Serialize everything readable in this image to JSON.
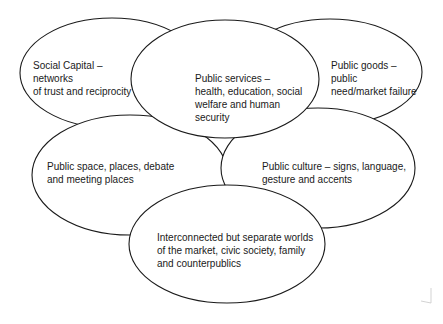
{
  "diagram": {
    "type": "overlapping-ellipses",
    "stroke_color": "#1a1a1a",
    "fill_color": "#ffffff",
    "nodes": [
      {
        "id": "social-capital",
        "label": "Social Capital  –\nnetworks\nof trust and reciprocity"
      },
      {
        "id": "public-goods",
        "label": "Public goods –\npublic\nneed/market failure"
      },
      {
        "id": "public-space",
        "label": "Public space, places, debate\nand meeting places"
      },
      {
        "id": "public-culture",
        "label": "Public culture – signs, language,\ngesture and accents"
      },
      {
        "id": "public-services",
        "label": "Public services –\nhealth, education, social\nwelfare and human\nsecurity"
      },
      {
        "id": "interconnected-worlds",
        "label": "Interconnected but separate worlds\nof the market, civic society, family\nand counterpublics"
      }
    ]
  }
}
